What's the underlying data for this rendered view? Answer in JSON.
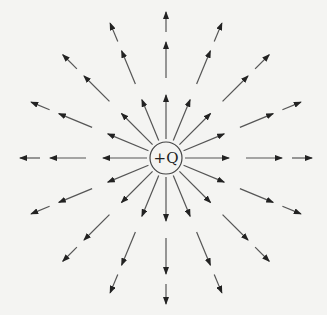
{
  "diagram": {
    "charge": {
      "label": "+Q",
      "cx": 166,
      "cy": 158,
      "r": 16
    },
    "ray_count": 16,
    "segments": [
      [
        19,
        63
      ],
      [
        80,
        116
      ],
      [
        126,
        146
      ]
    ],
    "colors": {
      "line": "#555555",
      "arrow": "#222222",
      "background": "#f4f4f2"
    }
  }
}
